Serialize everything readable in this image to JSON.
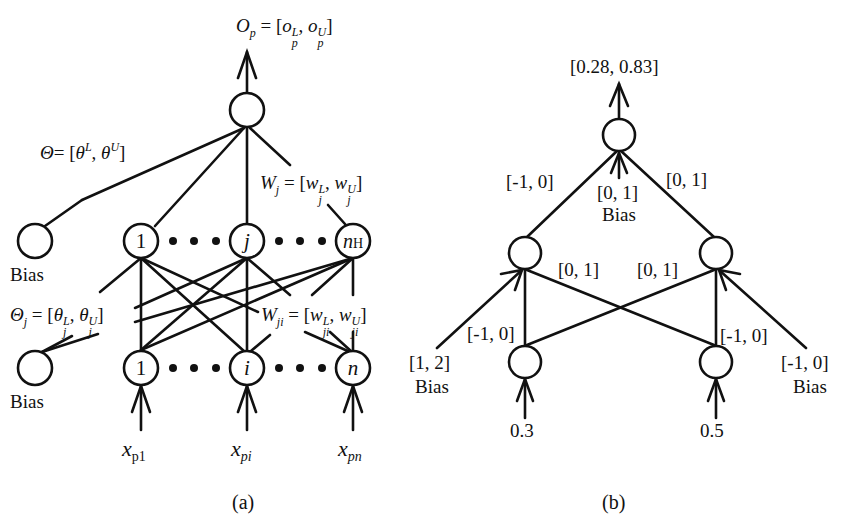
{
  "figure_a": {
    "caption": "(a)",
    "output_label": {
      "var": "O",
      "sub": "p",
      "eq": "= [",
      "lo": "o",
      "lo_sup": "L",
      "lo_sub": "p",
      "sep": ", ",
      "hi": "o",
      "hi_sup": "U",
      "hi_sub": "p",
      "close": "]"
    },
    "theta_label": {
      "var": "Θ",
      "eq": "= [",
      "lo": "θ",
      "lo_sup": "L",
      "sep": ", ",
      "hi": "θ",
      "hi_sup": "U",
      "close": "]"
    },
    "wj_label": {
      "var": "W",
      "sub": "j",
      "eq": "= [",
      "lo": "w",
      "lo_sup": "L",
      "lo_sub": "j",
      "sep": ", ",
      "hi": "w",
      "hi_sup": "U",
      "hi_sub": "j",
      "close": "]"
    },
    "thetaj_label": {
      "var": "Θ",
      "sub": "j",
      "eq": "= [",
      "lo": "θ",
      "lo_sup": "L",
      "lo_sub": "j",
      "sep": ", ",
      "hi": "θ",
      "hi_sup": "U",
      "hi_sub": "j",
      "close": "]"
    },
    "wji_label": {
      "var": "W",
      "sub": "ji",
      "eq": "= [",
      "lo": "w",
      "lo_sup": "L",
      "lo_sub": "ji",
      "sep": ", ",
      "hi": "w",
      "hi_sup": "U",
      "hi_sub": "ji",
      "close": "]"
    },
    "bias_top": "Bias",
    "bias_bottom": "Bias",
    "hidden_nodes": [
      "1",
      "j",
      "n"
    ],
    "hidden_last_sub": "H",
    "input_nodes": [
      "1",
      "i",
      "n"
    ],
    "inputs": [
      {
        "var": "x",
        "sub": "p1"
      },
      {
        "var": "x",
        "sub": "pi"
      },
      {
        "var": "x",
        "sub": "pn"
      }
    ]
  },
  "figure_b": {
    "caption": "(b)",
    "output": "[0.28, 0.83]",
    "w_left_out": "[-1, 0]",
    "w_right_out": "[0, 1]",
    "bias_out": "[0, 1]",
    "bias_out_label": "Bias",
    "w_cross_left": "[0, 1]",
    "w_cross_right": "[0, 1]",
    "w_vert_left": "[-1, 0]",
    "w_vert_right": "[-1, 0]",
    "bias_left": "[1, 2]",
    "bias_left_label": "Bias",
    "bias_right": "[-1, 0]",
    "bias_right_label": "Bias",
    "inputs": [
      "0.3",
      "0.5"
    ]
  }
}
